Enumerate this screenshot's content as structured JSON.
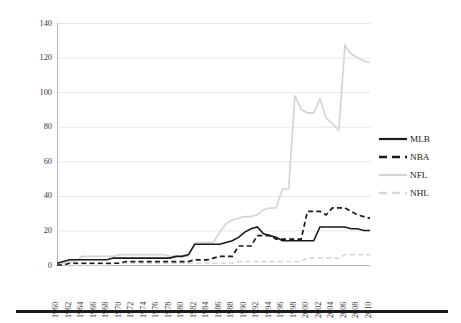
{
  "chart_data": {
    "type": "line",
    "title": "",
    "xlabel": "",
    "ylabel": "Millions of dollars (2010 dollars)",
    "ylim": [
      0,
      140
    ],
    "ytick_labels": [
      "0",
      "20",
      "40",
      "60",
      "80",
      "100",
      "120",
      "140"
    ],
    "ytick_values": [
      0,
      20,
      40,
      60,
      80,
      100,
      120,
      140
    ],
    "grid": true,
    "grid_axis": "y",
    "legend_position": "right",
    "x": [
      1960,
      1961,
      1962,
      1963,
      1964,
      1965,
      1966,
      1967,
      1968,
      1969,
      1970,
      1971,
      1972,
      1973,
      1974,
      1975,
      1976,
      1977,
      1978,
      1979,
      1980,
      1981,
      1982,
      1983,
      1984,
      1985,
      1986,
      1987,
      1988,
      1989,
      1990,
      1991,
      1992,
      1993,
      1994,
      1995,
      1996,
      1997,
      1998,
      1999,
      2000,
      2001,
      2002,
      2003,
      2004,
      2005,
      2006,
      2007,
      2008,
      2009,
      2010
    ],
    "xtick_labels": [
      "1960",
      "1962",
      "1964",
      "1966",
      "1968",
      "1970",
      "1972",
      "1974",
      "1976",
      "1978",
      "1980",
      "1982",
      "1984",
      "1986",
      "1988",
      "1990",
      "1992",
      "1994",
      "1996",
      "1998",
      "2000",
      "2002",
      "2004",
      "2006",
      "2008",
      "2010"
    ],
    "xlim": [
      1960,
      2010
    ],
    "series": [
      {
        "name": "MLB",
        "color": "#1a1a1a",
        "style": "solid",
        "values": [
          1,
          2,
          3,
          3,
          3,
          3,
          3,
          3,
          3,
          4,
          4,
          4,
          4,
          4,
          4,
          4,
          4,
          4,
          4,
          5,
          5,
          6,
          12,
          12,
          12,
          12,
          12,
          13,
          14,
          16,
          19,
          21,
          22,
          18,
          17,
          16,
          14,
          14,
          14,
          14,
          14,
          14,
          22,
          22,
          22,
          22,
          22,
          21,
          21,
          20,
          20
        ]
      },
      {
        "name": "NBA",
        "color": "#1a1a1a",
        "style": "dashed",
        "values": [
          0,
          0,
          1,
          1,
          1,
          1,
          1,
          1,
          1,
          1,
          1,
          2,
          2,
          2,
          2,
          2,
          2,
          2,
          2,
          2,
          2,
          2,
          3,
          3,
          3,
          4,
          5,
          5,
          5,
          11,
          11,
          11,
          17,
          17,
          17,
          15,
          15,
          15,
          15,
          15,
          31,
          31,
          31,
          29,
          33,
          33,
          33,
          31,
          29,
          28,
          27
        ]
      },
      {
        "name": "NFL",
        "color": "#d3d3d3",
        "style": "solid",
        "values": [
          1,
          1,
          2,
          2,
          5,
          5,
          5,
          5,
          5,
          5,
          6,
          6,
          6,
          6,
          6,
          6,
          6,
          6,
          5,
          5,
          5,
          5,
          13,
          13,
          13,
          13,
          19,
          24,
          26,
          27,
          28,
          28,
          29,
          32,
          33,
          33,
          44,
          44,
          98,
          90,
          88,
          88,
          96,
          85,
          82,
          78,
          127,
          122,
          120,
          118,
          117
        ]
      },
      {
        "name": "NHL",
        "color": "#d8d8d8",
        "style": "dashed",
        "values": [
          0,
          0,
          0,
          0,
          0,
          0,
          0,
          0,
          0,
          1,
          1,
          1,
          1,
          1,
          1,
          1,
          1,
          1,
          1,
          1,
          1,
          1,
          1,
          1,
          1,
          1,
          1,
          1,
          1,
          2,
          2,
          2,
          2,
          2,
          2,
          2,
          2,
          2,
          2,
          2,
          4,
          4,
          4,
          4,
          4,
          4,
          6,
          6,
          6,
          6,
          6
        ]
      }
    ]
  },
  "legend": {
    "items": [
      {
        "label": "MLB"
      },
      {
        "label": "NBA"
      },
      {
        "label": "NFL"
      },
      {
        "label": "NHL"
      }
    ]
  }
}
